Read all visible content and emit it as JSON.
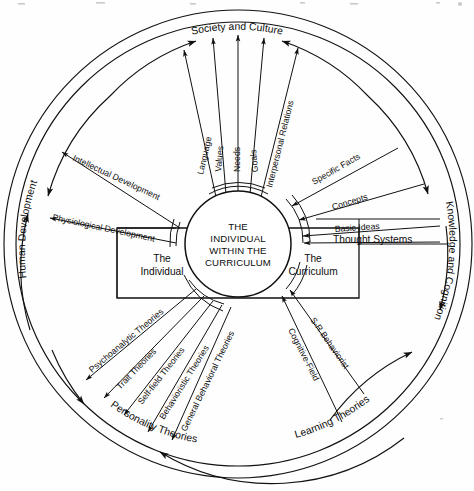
{
  "diagram": {
    "title": "The Individual Within the Curriculum",
    "center": {
      "line1": "THE",
      "line2": "INDIVIDUAL",
      "line3": "WITHIN THE",
      "line4": "CURRICULUM"
    },
    "boxes": [
      {
        "id": "individual-box",
        "line1": "The",
        "line2": "Individual"
      },
      {
        "id": "curriculum-box",
        "line1": "The",
        "line2": "Curriculum"
      }
    ],
    "arcs": [
      {
        "id": "society-and-culture",
        "label": "Society and Culture"
      },
      {
        "id": "knowledge-and-cognition",
        "label": "Knowledge and Cognition"
      },
      {
        "id": "human-development",
        "label": "Human Development"
      },
      {
        "id": "personality-theories",
        "label": "Personality Theories"
      },
      {
        "id": "learning-theories",
        "label": "Learning Theories"
      }
    ],
    "spokes": {
      "society_and_culture": [
        {
          "label": "Language"
        },
        {
          "label": "Values"
        },
        {
          "label": "Needs"
        },
        {
          "label": "Goals"
        },
        {
          "label": "Interpersonal Relations"
        }
      ],
      "knowledge_and_cognition": [
        {
          "label": "Specific Facts"
        },
        {
          "label": "Concepts"
        },
        {
          "label": "Basic Ideas"
        },
        {
          "label": "Thought Systems"
        }
      ],
      "human_development": [
        {
          "label": "Intellectual Development"
        },
        {
          "label": "Physiological Development"
        }
      ],
      "personality_theories": [
        {
          "label": "Psychoanalytic Theories"
        },
        {
          "label": "Trait Theories"
        },
        {
          "label": "Self-field Theories"
        },
        {
          "label": "Behavioristic Theories"
        },
        {
          "label": "General Behavioral Theories"
        }
      ],
      "learning_theories": [
        {
          "label": "S-R Behaviorist"
        },
        {
          "label": "Cognitive-Field"
        }
      ]
    },
    "colors": {
      "ink": "#111111",
      "paper": "#fefefe"
    }
  }
}
